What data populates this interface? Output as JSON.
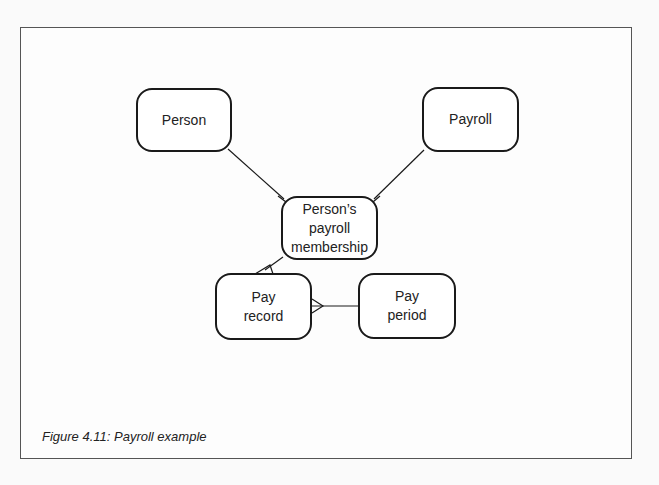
{
  "figure": {
    "caption": "Figure 4.11: Payroll example"
  },
  "entities": {
    "person": {
      "label": "Person"
    },
    "payroll": {
      "label": "Payroll"
    },
    "membership": {
      "label": "Person’s payroll membership"
    },
    "pay_record": {
      "label": "Pay record"
    },
    "pay_period": {
      "label": "Pay period"
    }
  },
  "relationships": [
    {
      "from": "Person",
      "to": "Person’s payroll membership",
      "many_end": "Person’s payroll membership"
    },
    {
      "from": "Payroll",
      "to": "Person’s payroll membership",
      "many_end": "Person’s payroll membership"
    },
    {
      "from": "Person’s payroll membership",
      "to": "Pay record",
      "many_end": "Pay record"
    },
    {
      "from": "Pay period",
      "to": "Pay record",
      "many_end": "Pay record"
    }
  ],
  "colors": {
    "stroke": "#1a1a1a",
    "frame": "#555555",
    "background": "#fdfdfd"
  }
}
